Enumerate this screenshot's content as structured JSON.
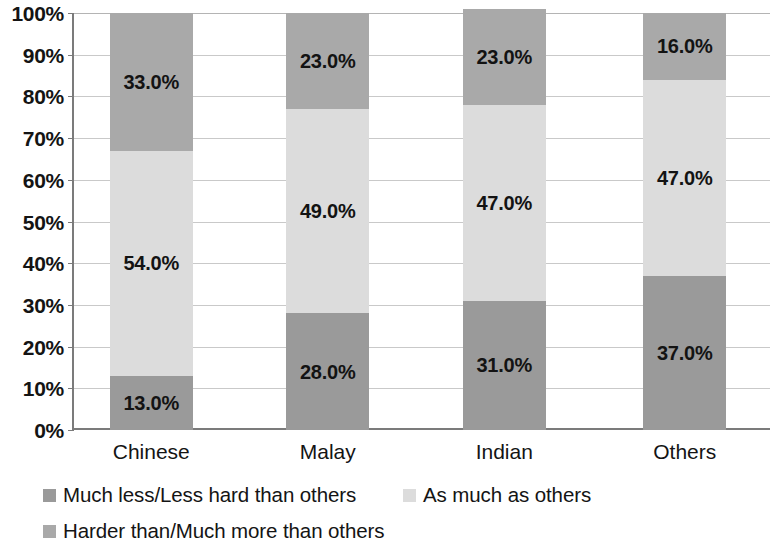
{
  "chart_data": {
    "type": "bar",
    "subtype": "stacked-100-percent",
    "title": "",
    "subtitle": "",
    "xlabel": "",
    "ylabel": "",
    "categories": [
      "Chinese",
      "Malay",
      "Indian",
      "Others"
    ],
    "ylim": [
      0,
      100
    ],
    "ytick_labels": [
      "0%",
      "10%",
      "20%",
      "30%",
      "40%",
      "50%",
      "60%",
      "70%",
      "80%",
      "90%",
      "100%"
    ],
    "ytick_values": [
      0,
      10,
      20,
      30,
      40,
      50,
      60,
      70,
      80,
      90,
      100
    ],
    "grid": true,
    "grid_axis": "y",
    "legend_position": "bottom",
    "stack_order_bottom_to_top": [
      "Much less/Less hard than others",
      "As much as others",
      "Harder than/Much more than others"
    ],
    "series": [
      {
        "name": "Much less/Less hard than others",
        "color": "#9a9a9a",
        "values": [
          13.0,
          28.0,
          31.0,
          37.0
        ],
        "labels": [
          "13.0%",
          "28.0%",
          "31.0%",
          "37.0%"
        ]
      },
      {
        "name": "As much as others",
        "color": "#dcdcdc",
        "values": [
          54.0,
          49.0,
          47.0,
          47.0
        ],
        "labels": [
          "54.0%",
          "49.0%",
          "47.0%",
          "47.0%"
        ]
      },
      {
        "name": "Harder than/Much more than others",
        "color": "#a9a9a9",
        "values": [
          33.0,
          23.0,
          23.0,
          16.0
        ],
        "labels": [
          "33.0%",
          "23.0%",
          "23.0%",
          "16.0%"
        ]
      }
    ]
  },
  "axis": {
    "y_ticks": [
      {
        "label": "100%",
        "value": 100
      },
      {
        "label": "90%",
        "value": 90
      },
      {
        "label": "80%",
        "value": 80
      },
      {
        "label": "70%",
        "value": 70
      },
      {
        "label": "60%",
        "value": 60
      },
      {
        "label": "50%",
        "value": 50
      },
      {
        "label": "40%",
        "value": 40
      },
      {
        "label": "30%",
        "value": 30
      },
      {
        "label": "20%",
        "value": 20
      },
      {
        "label": "10%",
        "value": 10
      },
      {
        "label": "0%",
        "value": 0
      }
    ],
    "x_ticks": [
      {
        "label": "Chinese"
      },
      {
        "label": "Malay"
      },
      {
        "label": "Indian"
      },
      {
        "label": "Others"
      }
    ]
  },
  "legend": {
    "items": [
      {
        "label": "Much less/Less hard than others",
        "color": "#9a9a9a"
      },
      {
        "label": "As much as others",
        "color": "#dcdcdc"
      },
      {
        "label": "Harder than/Much more than others",
        "color": "#a9a9a9"
      }
    ]
  },
  "colors": {
    "series_much_less": "#9a9a9a",
    "series_as_much": "#dcdcdc",
    "series_harder": "#a9a9a9",
    "axis_line": "#7b7b7b",
    "gridline": "#c9c9c9",
    "text": "#141414",
    "background": "#ffffff"
  }
}
